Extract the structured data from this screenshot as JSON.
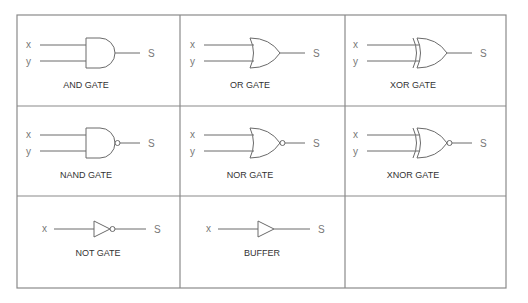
{
  "gates": [
    {
      "type": "and",
      "name": "AND GATE",
      "inputs": [
        "x",
        "y"
      ],
      "output": "S"
    },
    {
      "type": "or",
      "name": "OR GATE",
      "inputs": [
        "x",
        "y"
      ],
      "output": "S"
    },
    {
      "type": "xor",
      "name": "XOR GATE",
      "inputs": [
        "x",
        "y"
      ],
      "output": "S"
    },
    {
      "type": "nand",
      "name": "NAND GATE",
      "inputs": [
        "x",
        "y"
      ],
      "output": "S"
    },
    {
      "type": "nor",
      "name": "NOR GATE",
      "inputs": [
        "x",
        "y"
      ],
      "output": "S"
    },
    {
      "type": "xnor",
      "name": "XNOR GATE",
      "inputs": [
        "x",
        "y"
      ],
      "output": "S"
    },
    {
      "type": "not",
      "name": "NOT GATE",
      "inputs": [
        "x"
      ],
      "output": "S"
    },
    {
      "type": "buffer",
      "name": "BUFFER",
      "inputs": [
        "x"
      ],
      "output": "S"
    }
  ]
}
